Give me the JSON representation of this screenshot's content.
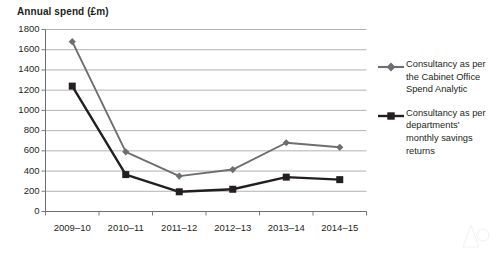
{
  "chart_data": {
    "type": "line",
    "title": "Annual spend (£m)",
    "xlabel": "",
    "ylabel": "",
    "ylim": [
      0,
      1800
    ],
    "ytick_step": 200,
    "yticks": [
      0,
      200,
      400,
      600,
      800,
      1000,
      1200,
      1400,
      1600,
      1800
    ],
    "grid": "horizontal",
    "legend_position": "right",
    "categories": [
      "2009–10",
      "2010–11",
      "2011–12",
      "2012–13",
      "2013–14",
      "2014–15"
    ],
    "series": [
      {
        "name": "Consultancy as per the Cabinet Office Spend Analytic",
        "marker": "diamond",
        "color": "#6d6e71",
        "values": [
          1680,
          590,
          350,
          415,
          680,
          635
        ]
      },
      {
        "name": "Consultancy as per departments' monthly savings returns",
        "marker": "square",
        "color": "#231f20",
        "values": [
          1240,
          365,
          195,
          220,
          340,
          315
        ]
      }
    ]
  },
  "legend": {
    "entries": [
      {
        "label": "Consultancy as per the Cabinet Office Spend Analytic",
        "marker": "diamond"
      },
      {
        "label": "Consultancy as per departments' monthly savings returns",
        "marker": "square"
      }
    ]
  },
  "colors": {
    "series_1": "#6d6e71",
    "series_2": "#231f20",
    "gridline": "#a7a9ac",
    "axis": "#6d6e71",
    "text": "#231f20",
    "background": "#ffffff"
  }
}
